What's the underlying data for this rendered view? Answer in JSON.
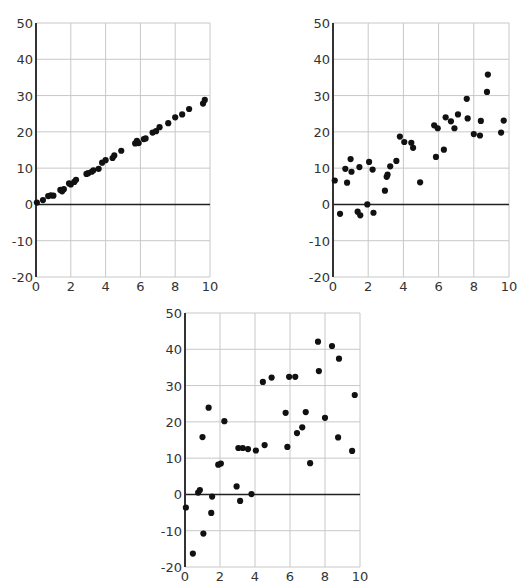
{
  "charts_layout": [
    {
      "id": "chart-1",
      "left": 36,
      "top": 23,
      "width": 174,
      "height": 254
    },
    {
      "id": "chart-2",
      "left": 333,
      "top": 23,
      "width": 176,
      "height": 254
    },
    {
      "id": "chart-3",
      "left": 185,
      "top": 313,
      "width": 175,
      "height": 254
    }
  ],
  "colors": {
    "grid": "#c8c8c8",
    "axis": "#333333",
    "point": "#111111",
    "zero_line": "#222222"
  },
  "chart_data": [
    {
      "type": "scatter",
      "title": "",
      "xlabel": "",
      "ylabel": "",
      "xlim": [
        0,
        10
      ],
      "ylim": [
        -20,
        50
      ],
      "xticks": [
        0,
        2,
        4,
        6,
        8,
        10
      ],
      "yticks": [
        -20,
        -10,
        0,
        10,
        20,
        30,
        40,
        50
      ],
      "grid": true,
      "legend": null,
      "x": [
        0.05,
        0.4,
        0.7,
        0.85,
        1.0,
        1.4,
        1.5,
        1.6,
        1.9,
        2.0,
        2.2,
        2.3,
        2.9,
        3.0,
        3.2,
        3.3,
        3.6,
        3.8,
        4.0,
        4.4,
        4.5,
        4.9,
        5.7,
        5.8,
        5.9,
        6.2,
        6.3,
        6.7,
        6.9,
        7.1,
        7.6,
        8.0,
        8.4,
        8.8,
        9.6,
        9.7
      ],
      "y": [
        0.5,
        1.2,
        2.3,
        2.5,
        2.4,
        4.0,
        3.6,
        4.2,
        5.8,
        5.5,
        6.2,
        6.8,
        8.4,
        8.6,
        9.0,
        9.4,
        9.8,
        11.5,
        12.2,
        12.8,
        13.5,
        14.8,
        16.8,
        17.5,
        16.9,
        18.0,
        18.2,
        19.8,
        20.2,
        21.3,
        22.4,
        24.0,
        24.8,
        26.3,
        27.8,
        28.8
      ]
    },
    {
      "type": "scatter",
      "title": "",
      "xlabel": "",
      "ylabel": "",
      "xlim": [
        0,
        10
      ],
      "ylim": [
        -20,
        50
      ],
      "xticks": [
        0,
        2,
        4,
        6,
        8,
        10
      ],
      "yticks": [
        -20,
        -10,
        0,
        10,
        20,
        30,
        40,
        50
      ],
      "grid": true,
      "legend": null,
      "x": [
        0.1,
        0.4,
        0.7,
        0.8,
        1.0,
        1.05,
        1.4,
        1.5,
        1.55,
        1.95,
        2.05,
        2.25,
        2.3,
        2.95,
        3.05,
        3.1,
        3.25,
        3.6,
        3.8,
        4.05,
        4.45,
        4.55,
        4.95,
        5.75,
        5.85,
        5.95,
        6.3,
        6.4,
        6.7,
        6.9,
        7.1,
        7.6,
        7.65,
        8.0,
        8.35,
        8.4,
        8.75,
        8.8,
        9.55,
        9.7
      ],
      "y": [
        6.6,
        -2.6,
        9.8,
        6.0,
        12.5,
        9.0,
        -2.0,
        10.3,
        -3.0,
        0.0,
        11.7,
        9.6,
        -2.3,
        3.8,
        7.6,
        8.2,
        10.5,
        12.0,
        18.7,
        17.2,
        17.0,
        15.6,
        6.1,
        21.8,
        13.1,
        21.0,
        15.1,
        24.0,
        22.9,
        21.0,
        24.8,
        29.1,
        23.7,
        19.4,
        19.0,
        23.0,
        31.0,
        35.8,
        19.8,
        23.1
      ]
    },
    {
      "type": "scatter",
      "title": "",
      "xlabel": "",
      "ylabel": "",
      "xlim": [
        0,
        10
      ],
      "ylim": [
        -20,
        50
      ],
      "xticks": [
        0,
        2,
        4,
        6,
        8,
        10
      ],
      "yticks": [
        -20,
        -10,
        0,
        10,
        20,
        30,
        40,
        50
      ],
      "grid": true,
      "legend": null,
      "x": [
        0.05,
        0.45,
        0.75,
        0.85,
        1.0,
        1.05,
        1.35,
        1.5,
        1.55,
        1.9,
        2.05,
        2.25,
        2.95,
        3.05,
        3.15,
        3.3,
        3.6,
        3.8,
        4.05,
        4.45,
        4.55,
        4.95,
        5.75,
        5.85,
        5.95,
        6.3,
        6.4,
        6.7,
        6.9,
        7.15,
        7.6,
        7.65,
        8.0,
        8.4,
        8.75,
        8.8,
        9.55,
        9.7
      ],
      "y": [
        -3.6,
        -16.3,
        0.5,
        1.2,
        15.8,
        -10.8,
        23.9,
        -5.1,
        -0.6,
        8.2,
        8.5,
        20.2,
        2.2,
        12.8,
        -1.8,
        12.8,
        12.5,
        0.1,
        12.1,
        31.0,
        13.6,
        32.2,
        22.5,
        13.1,
        32.4,
        32.4,
        16.9,
        18.5,
        22.7,
        8.6,
        42.1,
        34.0,
        21.1,
        40.9,
        15.7,
        37.4,
        12.0,
        27.4
      ]
    }
  ]
}
